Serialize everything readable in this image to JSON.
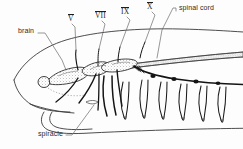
{
  "figure": {
    "style": "black and white line drawing with stippled shading",
    "background_color": "#fdfdfd",
    "ink_color": "#1d1d1d",
    "label_color": "#2b2b2b"
  },
  "labels": {
    "brain": "brain",
    "nerve_v": "V",
    "nerve_vii": "VII",
    "nerve_ix": "IX",
    "nerve_x": "X",
    "spinal_cord": "spinal cord",
    "spiracle": "spiracle"
  },
  "label_positions": {
    "brain": {
      "x": 18,
      "y": 30
    },
    "nerve_v": {
      "x": 68,
      "y": 17
    },
    "nerve_vii": {
      "x": 96,
      "y": 14
    },
    "nerve_ix": {
      "x": 121,
      "y": 10
    },
    "nerve_x": {
      "x": 146,
      "y": 5
    },
    "spinal_cord": {
      "x": 177,
      "y": 4
    },
    "spiracle": {
      "x": 40,
      "y": 132
    }
  },
  "structures": [
    {
      "name": "body-outline",
      "description": "tapering shark head and trunk outline"
    },
    {
      "name": "lower-jaw",
      "description": "curved lower jaw and mouth outline"
    },
    {
      "name": "brain",
      "description": "stippled brain mass with olfactory bulb at anterior end"
    },
    {
      "name": "spinal-cord",
      "description": "long stippled cord extending posteriorly"
    },
    {
      "name": "cranial-nerve-v",
      "description": "trigeminal nerve root"
    },
    {
      "name": "cranial-nerve-vii",
      "description": "facial nerve root"
    },
    {
      "name": "cranial-nerve-ix",
      "description": "glossopharyngeal nerve root"
    },
    {
      "name": "cranial-nerve-x",
      "description": "vagus nerve root with branchial branches"
    },
    {
      "name": "spiracle",
      "description": "spiracular opening behind the eye"
    },
    {
      "name": "gill-arch-nerves",
      "description": "series of looping branchial nerve pairs"
    },
    {
      "name": "dorsal-root-ganglia",
      "description": "row of dark beads along the spinal nerve trunk"
    },
    {
      "name": "spinal-nerves",
      "description": "ventral spinal nerve branches descending from the cord"
    }
  ]
}
